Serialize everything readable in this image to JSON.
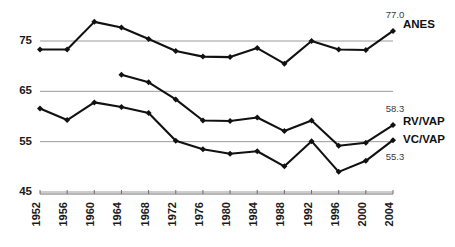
{
  "chart_data": {
    "type": "line",
    "title": "",
    "subtitle": "",
    "xlabel": "",
    "ylabel": "",
    "grid": true,
    "legend_position": "right-inline",
    "xlim": [
      1952,
      2004
    ],
    "ylim": [
      43.5,
      80.5
    ],
    "yticks": [
      45,
      55,
      65,
      75
    ],
    "categories": [
      1952,
      1956,
      1960,
      1964,
      1968,
      1972,
      1976,
      1980,
      1984,
      1988,
      1992,
      1996,
      2000,
      2004
    ],
    "xtick_labels": [
      "1952",
      "1956",
      "1960",
      "1964",
      "1968",
      "1972",
      "1976",
      "1980",
      "1984",
      "1988",
      "1992",
      "1996",
      "2000",
      "2004"
    ],
    "series": [
      {
        "name": "ANES",
        "label": "ANES",
        "color": "#111111",
        "end_value_label": "77.0",
        "values": [
          73.3,
          73.3,
          78.8,
          77.7,
          75.4,
          73.0,
          71.9,
          71.8,
          73.6,
          70.5,
          75.0,
          73.3,
          73.2,
          77.0
        ]
      },
      {
        "name": "RV/VAP",
        "label": "RV/VAP",
        "color": "#111111",
        "end_value_label": "58.3",
        "values": [
          null,
          null,
          null,
          68.3,
          66.8,
          63.4,
          59.2,
          59.1,
          59.8,
          57.1,
          59.2,
          54.2,
          54.8,
          58.3
        ]
      },
      {
        "name": "VC/VAP",
        "label": "VC/VAP",
        "color": "#111111",
        "end_value_label": "55.3",
        "values": [
          61.6,
          59.3,
          62.8,
          61.9,
          60.7,
          55.2,
          53.5,
          52.6,
          53.1,
          50.1,
          55.1,
          49.0,
          51.2,
          55.3
        ]
      }
    ]
  }
}
